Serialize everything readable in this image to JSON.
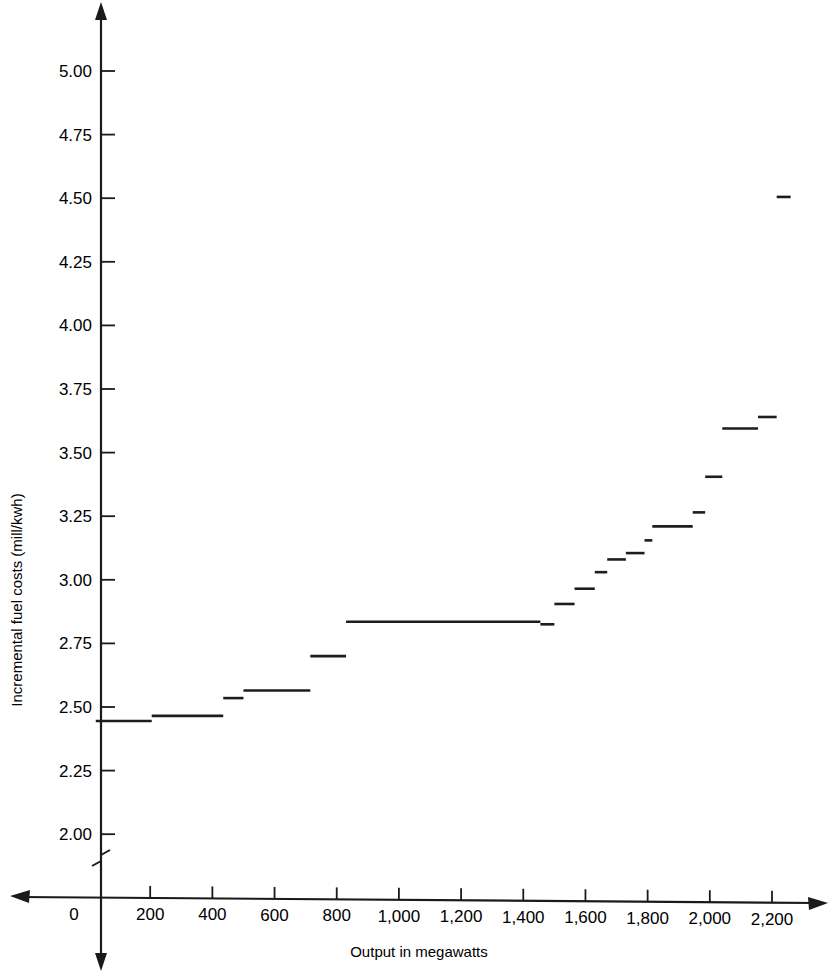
{
  "chart_data": {
    "type": "line",
    "subtype": "step",
    "title": "",
    "xlabel": "Output in megawatts",
    "ylabel": "Incremental fuel costs (mill/kwh)",
    "xlim": [
      0,
      2300
    ],
    "ylim": [
      1.9,
      5.1
    ],
    "y_axis_break": true,
    "y_break_note": "axis broken below 2.00",
    "grid": false,
    "legend": null,
    "xticks": [
      0,
      200,
      400,
      600,
      800,
      1000,
      1200,
      1400,
      1600,
      1800,
      2000,
      2200
    ],
    "xtick_labels": [
      "0",
      "200",
      "400",
      "600",
      "800",
      "1,000",
      "1,200",
      "1,400",
      "1,600",
      "1,800",
      "2,000",
      "2,200"
    ],
    "yticks": [
      2.0,
      2.25,
      2.5,
      2.75,
      3.0,
      3.25,
      3.5,
      3.75,
      4.0,
      4.25,
      4.5,
      4.75,
      5.0
    ],
    "ytick_labels": [
      "2.00",
      "2.25",
      "2.50",
      "2.75",
      "3.00",
      "3.25",
      "3.50",
      "3.75",
      "4.00",
      "4.25",
      "4.50",
      "4.75",
      "5.00"
    ],
    "line_color": "#1d1d1d",
    "segments": [
      {
        "x_start": 25,
        "x_end": 205,
        "y": 2.445
      },
      {
        "x_start": 205,
        "x_end": 435,
        "y": 2.465
      },
      {
        "x_start": 435,
        "x_end": 500,
        "y": 2.535
      },
      {
        "x_start": 500,
        "x_end": 715,
        "y": 2.565
      },
      {
        "x_start": 715,
        "x_end": 830,
        "y": 2.7
      },
      {
        "x_start": 830,
        "x_end": 1455,
        "y": 2.835
      },
      {
        "x_start": 1455,
        "x_end": 1500,
        "y": 2.825
      },
      {
        "x_start": 1500,
        "x_end": 1565,
        "y": 2.905
      },
      {
        "x_start": 1565,
        "x_end": 1630,
        "y": 2.965
      },
      {
        "x_start": 1630,
        "x_end": 1670,
        "y": 3.03
      },
      {
        "x_start": 1670,
        "x_end": 1730,
        "y": 3.08
      },
      {
        "x_start": 1730,
        "x_end": 1790,
        "y": 3.105
      },
      {
        "x_start": 1790,
        "x_end": 1815,
        "y": 3.155
      },
      {
        "x_start": 1815,
        "x_end": 1945,
        "y": 3.21
      },
      {
        "x_start": 1945,
        "x_end": 1985,
        "y": 3.265
      },
      {
        "x_start": 1985,
        "x_end": 2040,
        "y": 3.405
      },
      {
        "x_start": 2040,
        "x_end": 2155,
        "y": 3.595
      },
      {
        "x_start": 2155,
        "x_end": 2215,
        "y": 3.64
      },
      {
        "x_start": 2215,
        "x_end": 2260,
        "y": 4.505
      }
    ]
  },
  "axes": {
    "x_axis_name": "output-axis",
    "y_axis_name": "cost-axis",
    "x_axis_label": "Output in megawatts",
    "y_axis_label": "Incremental fuel costs (mill/kwh)"
  }
}
